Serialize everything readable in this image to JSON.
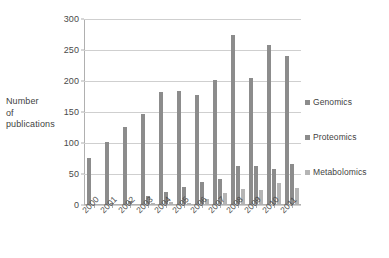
{
  "chart_data": {
    "type": "bar",
    "title": "",
    "subtitle": "",
    "xlabel": "",
    "ylabel": "Number of publications",
    "ylabel_lines": [
      "Number",
      "of",
      "publications"
    ],
    "categories": [
      "2000",
      "2001",
      "2002",
      "2003",
      "2004",
      "2005",
      "2006",
      "2007",
      "2008",
      "2009",
      "2010",
      "2011"
    ],
    "series": [
      {
        "name": "Genomics",
        "color": "#8c8c8c",
        "values": [
          75,
          100,
          124,
          145,
          181,
          183,
          176,
          200,
          272,
          203,
          256,
          238
        ]
      },
      {
        "name": "Proteomics",
        "color": "#8c8c8c",
        "values": [
          0,
          1,
          5,
          13,
          19,
          28,
          35,
          40,
          62,
          61,
          57,
          65
        ]
      },
      {
        "name": "Metabolomics",
        "color": "#b5b5b5",
        "values": [
          0,
          0,
          0,
          1,
          4,
          2,
          8,
          17,
          25,
          23,
          34,
          26
        ]
      }
    ],
    "ylim": [
      0,
      300
    ],
    "ytick_values": [
      0,
      50,
      100,
      150,
      200,
      250,
      300
    ],
    "ytick_labels": [
      "0",
      "50",
      "100",
      "150",
      "200",
      "250",
      "300"
    ],
    "grid": true,
    "legend_position": "right",
    "legend_entries": [
      "Genomics",
      "Proteomics",
      "Metabolomics"
    ],
    "xtick_rotation": -45
  }
}
